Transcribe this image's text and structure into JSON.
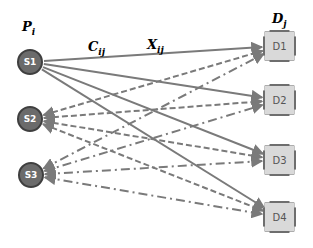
{
  "diagram": {
    "labels": {
      "sources_header": {
        "base": "P",
        "sub": "i"
      },
      "destinations_header": {
        "base": "D",
        "sub": "j"
      },
      "cost_label": {
        "base": "C",
        "sub": "ij"
      },
      "flow_label": {
        "base": "X",
        "sub": "ij"
      }
    },
    "sources": [
      {
        "id": "S1",
        "label": "S1",
        "x": 30,
        "y": 62
      },
      {
        "id": "S2",
        "label": "S2",
        "x": 30,
        "y": 119
      },
      {
        "id": "S3",
        "label": "S3",
        "x": 31,
        "y": 175
      }
    ],
    "destinations": [
      {
        "id": "D1",
        "label": "D1",
        "x": 279,
        "y": 46
      },
      {
        "id": "D2",
        "label": "D2",
        "x": 279,
        "y": 100
      },
      {
        "id": "D3",
        "label": "D3",
        "x": 279,
        "y": 160
      },
      {
        "id": "D4",
        "label": "D4",
        "x": 279,
        "y": 217
      }
    ],
    "edges": [
      {
        "from": "S1",
        "to": "D1",
        "style": "solid"
      },
      {
        "from": "S1",
        "to": "D2",
        "style": "solid"
      },
      {
        "from": "S1",
        "to": "D3",
        "style": "solid"
      },
      {
        "from": "S1",
        "to": "D4",
        "style": "solid"
      },
      {
        "from": "S2",
        "to": "D1",
        "style": "dashed"
      },
      {
        "from": "S2",
        "to": "D2",
        "style": "dashed"
      },
      {
        "from": "S2",
        "to": "D3",
        "style": "dashed"
      },
      {
        "from": "S2",
        "to": "D4",
        "style": "dashed"
      },
      {
        "from": "S3",
        "to": "D1",
        "style": "dash-dot"
      },
      {
        "from": "S3",
        "to": "D2",
        "style": "dash-dot"
      },
      {
        "from": "S3",
        "to": "D3",
        "style": "dash-dot"
      },
      {
        "from": "S3",
        "to": "D4",
        "style": "dash-dot"
      }
    ],
    "colors": {
      "edge": "#7a7a7a",
      "source_fill": "#6b6b6b",
      "source_border": "#3f3f3f",
      "dest_fill": "#d9d9d9",
      "dest_border": "#6e6e6e"
    }
  }
}
